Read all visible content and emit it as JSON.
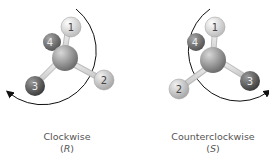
{
  "panels": [
    {
      "id": "left",
      "direction_label": "Clockwise",
      "configuration": "R",
      "substituents": [
        {
          "priority": "1",
          "color": "#e6e6e6"
        },
        {
          "priority": "2",
          "color": "#d2d2d2"
        },
        {
          "priority": "3",
          "color": "#6a6a6a"
        },
        {
          "priority": "4",
          "color": "#7a7a7a"
        }
      ]
    },
    {
      "id": "right",
      "direction_label": "Counterclockwise",
      "configuration": "S",
      "substituents": [
        {
          "priority": "1",
          "color": "#e6e6e6"
        },
        {
          "priority": "2",
          "color": "#d2d2d2"
        },
        {
          "priority": "3",
          "color": "#6a6a6a"
        },
        {
          "priority": "4",
          "color": "#7a7a7a"
        }
      ]
    }
  ],
  "paren_open": "(",
  "paren_close": ")"
}
